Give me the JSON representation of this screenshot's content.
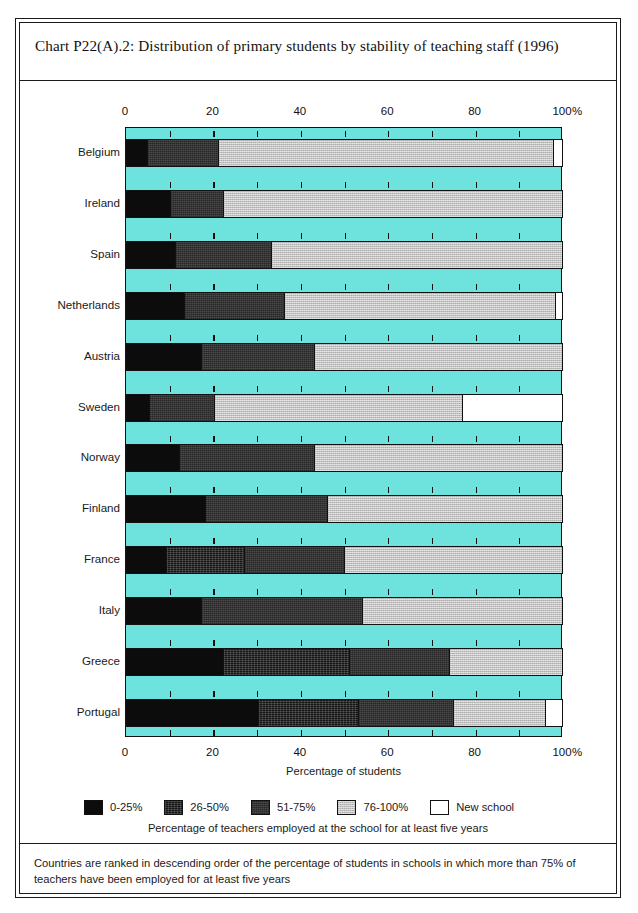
{
  "chart_title": "Chart P22(A).2: Distribution of primary students by stability of teaching staff (1996)",
  "axis": {
    "tick_labels": [
      "0",
      "20",
      "40",
      "60",
      "80",
      "100"
    ],
    "tick_values": [
      0,
      20,
      40,
      60,
      80,
      100
    ],
    "minor_tick_values": [
      10,
      30,
      50,
      70,
      90
    ],
    "percent_symbol": "%",
    "xlabel": "Percentage of students"
  },
  "legend": {
    "items": [
      {
        "label": "0-25%",
        "swatch": "black-swatch",
        "color": "#0c0c0c"
      },
      {
        "label": "26-50%",
        "swatch": "very-dark-gray-swatch",
        "color": "#151515"
      },
      {
        "label": "51-75%",
        "swatch": "dark-gray-swatch",
        "color": "#4a4a4a"
      },
      {
        "label": "76-100%",
        "swatch": "light-gray-swatch",
        "color": "#c2c2c2"
      },
      {
        "label": "New school",
        "swatch": "white-swatch",
        "color": "#ffffff"
      }
    ],
    "caption": "Percentage of teachers employed at the school for at least five years"
  },
  "footnote": "Countries are ranked in descending order of the percentage of students in schools in which more than 75% of teachers have been employed for at least five years",
  "colors": {
    "plot_background": "#6ee2dc",
    "frame": "#1a1a1a",
    "band_0_25": "#0c0c0c",
    "band_26_50": "#151515",
    "band_51_75": "#4a4a4a",
    "band_76_100": "#c2c2c2",
    "band_new_school": "#ffffff"
  },
  "chart_data": {
    "type": "bar",
    "orientation": "horizontal",
    "stacked": true,
    "title": "Chart P22(A).2: Distribution of primary students by stability of teaching staff (1996)",
    "xlabel": "Percentage of students",
    "ylabel": "",
    "xlim": [
      0,
      100
    ],
    "grid": true,
    "legend_position": "bottom",
    "categories": [
      "Belgium",
      "Ireland",
      "Spain",
      "Netherlands",
      "Austria",
      "Sweden",
      "Norway",
      "Finland",
      "France",
      "Italy",
      "Greece",
      "Portugal"
    ],
    "series": [
      {
        "name": "0-25%",
        "values": [
          4.5,
          10.0,
          11.0,
          13.0,
          17.0,
          5.0,
          12.0,
          18.0,
          9.0,
          17.0,
          22.0,
          30.0
        ]
      },
      {
        "name": "26-50%",
        "values": [
          0.0,
          0.0,
          0.0,
          0.0,
          0.0,
          0.0,
          0.0,
          0.0,
          18.0,
          0.0,
          29.0,
          23.0
        ]
      },
      {
        "name": "51-75%",
        "values": [
          16.5,
          12.0,
          22.0,
          23.0,
          26.0,
          15.0,
          31.0,
          28.0,
          23.0,
          37.0,
          23.0,
          22.0
        ]
      },
      {
        "name": "76-100%",
        "values": [
          77.0,
          78.0,
          67.0,
          62.5,
          57.0,
          57.0,
          57.0,
          54.0,
          50.0,
          46.0,
          26.0,
          21.0
        ]
      },
      {
        "name": "New school",
        "values": [
          2.0,
          0.0,
          0.0,
          1.5,
          0.0,
          23.0,
          0.0,
          0.0,
          0.0,
          0.0,
          0.0,
          4.0
        ]
      }
    ],
    "bars": [
      {
        "category": "Belgium",
        "segments": [
          {
            "band": "0-25%",
            "start": 0,
            "end": 4.5
          },
          {
            "band": "51-75%",
            "start": 4.5,
            "end": 21.0
          },
          {
            "band": "76-100%",
            "start": 21.0,
            "end": 98.0
          },
          {
            "band": "New school",
            "start": 98.0,
            "end": 100.0
          }
        ]
      },
      {
        "category": "Ireland",
        "segments": [
          {
            "band": "0-25%",
            "start": 0,
            "end": 10.0
          },
          {
            "band": "51-75%",
            "start": 10.0,
            "end": 22.0
          },
          {
            "band": "76-100%",
            "start": 22.0,
            "end": 100.0
          }
        ]
      },
      {
        "category": "Spain",
        "segments": [
          {
            "band": "0-25%",
            "start": 0,
            "end": 11.0
          },
          {
            "band": "51-75%",
            "start": 11.0,
            "end": 33.0
          },
          {
            "band": "76-100%",
            "start": 33.0,
            "end": 100.0
          }
        ]
      },
      {
        "category": "Netherlands",
        "segments": [
          {
            "band": "0-25%",
            "start": 0,
            "end": 13.0
          },
          {
            "band": "51-75%",
            "start": 13.0,
            "end": 36.0
          },
          {
            "band": "76-100%",
            "start": 36.0,
            "end": 98.5
          },
          {
            "band": "New school",
            "start": 98.5,
            "end": 100.0
          }
        ]
      },
      {
        "category": "Austria",
        "segments": [
          {
            "band": "0-25%",
            "start": 0,
            "end": 17.0
          },
          {
            "band": "51-75%",
            "start": 17.0,
            "end": 43.0
          },
          {
            "band": "76-100%",
            "start": 43.0,
            "end": 100.0
          }
        ]
      },
      {
        "category": "Sweden",
        "segments": [
          {
            "band": "0-25%",
            "start": 0,
            "end": 5.0
          },
          {
            "band": "51-75%",
            "start": 5.0,
            "end": 20.0
          },
          {
            "band": "76-100%",
            "start": 20.0,
            "end": 77.0
          },
          {
            "band": "New school",
            "start": 77.0,
            "end": 100.0
          }
        ]
      },
      {
        "category": "Norway",
        "segments": [
          {
            "band": "0-25%",
            "start": 0,
            "end": 12.0
          },
          {
            "band": "51-75%",
            "start": 12.0,
            "end": 43.0
          },
          {
            "band": "76-100%",
            "start": 43.0,
            "end": 100.0
          }
        ]
      },
      {
        "category": "Finland",
        "segments": [
          {
            "band": "0-25%",
            "start": 0,
            "end": 18.0
          },
          {
            "band": "51-75%",
            "start": 18.0,
            "end": 46.0
          },
          {
            "band": "76-100%",
            "start": 46.0,
            "end": 100.0
          }
        ]
      },
      {
        "category": "France",
        "segments": [
          {
            "band": "0-25%",
            "start": 0,
            "end": 9.0
          },
          {
            "band": "26-50%",
            "start": 9.0,
            "end": 27.0
          },
          {
            "band": "51-75%",
            "start": 27.0,
            "end": 50.0
          },
          {
            "band": "76-100%",
            "start": 50.0,
            "end": 100.0
          }
        ]
      },
      {
        "category": "Italy",
        "segments": [
          {
            "band": "0-25%",
            "start": 0,
            "end": 17.0
          },
          {
            "band": "51-75%",
            "start": 17.0,
            "end": 54.0
          },
          {
            "band": "76-100%",
            "start": 54.0,
            "end": 100.0
          }
        ]
      },
      {
        "category": "Greece",
        "segments": [
          {
            "band": "0-25%",
            "start": 0,
            "end": 22.0
          },
          {
            "band": "26-50%",
            "start": 22.0,
            "end": 51.0
          },
          {
            "band": "51-75%",
            "start": 51.0,
            "end": 74.0
          },
          {
            "band": "76-100%",
            "start": 74.0,
            "end": 100.0
          }
        ]
      },
      {
        "category": "Portugal",
        "segments": [
          {
            "band": "0-25%",
            "start": 0,
            "end": 30.0
          },
          {
            "band": "26-50%",
            "start": 30.0,
            "end": 53.0
          },
          {
            "band": "51-75%",
            "start": 53.0,
            "end": 75.0
          },
          {
            "band": "76-100%",
            "start": 75.0,
            "end": 96.0
          },
          {
            "band": "New school",
            "start": 96.0,
            "end": 100.0
          }
        ]
      }
    ]
  }
}
